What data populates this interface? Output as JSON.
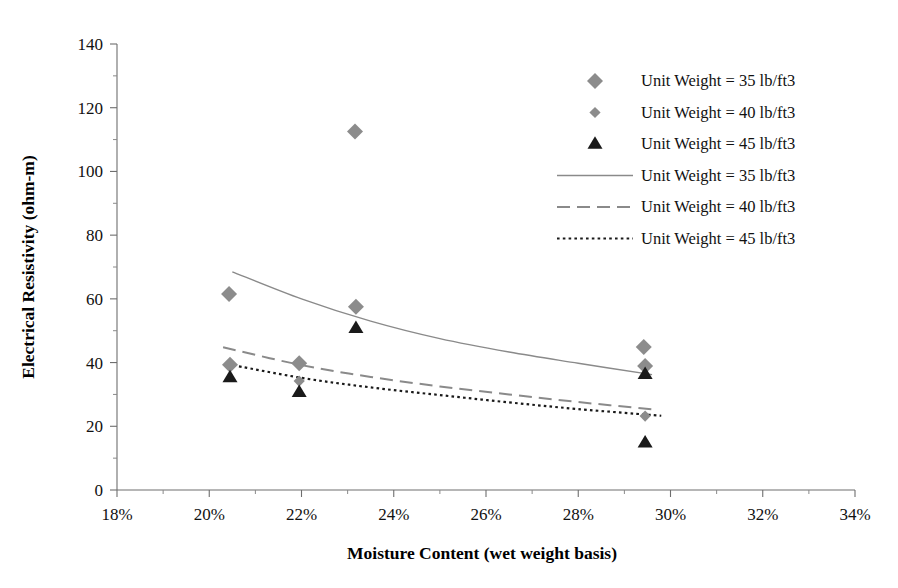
{
  "chart_data": {
    "type": "scatter",
    "title": "",
    "xlabel": "Moisture Content (wet weight basis)",
    "ylabel": "Electrical  Resistivity (ohm-m)",
    "xlim": [
      18,
      34
    ],
    "ylim": [
      0,
      140
    ],
    "x_ticks": [
      "18%",
      "20%",
      "22%",
      "24%",
      "26%",
      "28%",
      "30%",
      "32%",
      "34%"
    ],
    "x_tick_values": [
      18,
      20,
      22,
      24,
      26,
      28,
      30,
      32,
      34
    ],
    "x_minor_step": 1,
    "y_ticks": [
      "0",
      "20",
      "40",
      "60",
      "80",
      "100",
      "120",
      "140"
    ],
    "y_tick_values": [
      0,
      20,
      40,
      60,
      80,
      100,
      120,
      140
    ],
    "y_minor_step": 10,
    "grid": false,
    "legend_position": "top-right",
    "marker_color_35": "#8c8c8c",
    "marker_color_40": "#8c8c8c",
    "marker_color_45": "#1a1a1a",
    "line_color": "#8a8a8a",
    "series": [
      {
        "name": "Unit Weight = 35 lb/ft3",
        "kind": "scatter",
        "marker": "diamond-large",
        "color": "#8c8c8c",
        "points": [
          {
            "x": 20.43,
            "y": 61.5
          },
          {
            "x": 20.45,
            "y": 39.3
          },
          {
            "x": 21.95,
            "y": 39.8
          },
          {
            "x": 23.16,
            "y": 112.5
          },
          {
            "x": 23.18,
            "y": 57.5
          },
          {
            "x": 29.42,
            "y": 44.9
          },
          {
            "x": 29.45,
            "y": 38.9
          }
        ]
      },
      {
        "name": "Unit Weight = 40 lb/ft3",
        "kind": "scatter",
        "marker": "diamond-small",
        "color": "#8c8c8c",
        "points": [
          {
            "x": 21.95,
            "y": 34.2
          },
          {
            "x": 29.45,
            "y": 23.2
          }
        ]
      },
      {
        "name": "Unit Weight = 45 lb/ft3",
        "kind": "scatter",
        "marker": "triangle",
        "color": "#1a1a1a",
        "points": [
          {
            "x": 20.45,
            "y": 35.3
          },
          {
            "x": 21.95,
            "y": 30.7
          },
          {
            "x": 23.18,
            "y": 50.8
          },
          {
            "x": 29.45,
            "y": 36.3
          },
          {
            "x": 29.45,
            "y": 14.8
          }
        ]
      },
      {
        "name": "Unit Weight = 35 lb/ft3",
        "kind": "line",
        "style": "solid",
        "color": "#8a8a8a",
        "points": [
          {
            "x": 20.5,
            "y": 68.5
          },
          {
            "x": 22.0,
            "y": 60.0
          },
          {
            "x": 23.5,
            "y": 53.0
          },
          {
            "x": 25.0,
            "y": 47.5
          },
          {
            "x": 26.5,
            "y": 43.3
          },
          {
            "x": 28.0,
            "y": 39.8
          },
          {
            "x": 29.6,
            "y": 36.2
          }
        ]
      },
      {
        "name": "Unit Weight = 40 lb/ft3",
        "kind": "line",
        "style": "dashed",
        "color": "#8a8a8a",
        "points": [
          {
            "x": 20.3,
            "y": 44.8
          },
          {
            "x": 22.0,
            "y": 39.2
          },
          {
            "x": 23.5,
            "y": 35.5
          },
          {
            "x": 25.0,
            "y": 32.5
          },
          {
            "x": 26.5,
            "y": 30.0
          },
          {
            "x": 28.0,
            "y": 27.6
          },
          {
            "x": 29.7,
            "y": 25.2
          }
        ]
      },
      {
        "name": "Unit Weight = 45 lb/ft3",
        "kind": "line",
        "style": "dotted",
        "color": "#1a1a1a",
        "points": [
          {
            "x": 20.4,
            "y": 39.5
          },
          {
            "x": 22.0,
            "y": 35.2
          },
          {
            "x": 23.5,
            "y": 32.2
          },
          {
            "x": 25.0,
            "y": 29.8
          },
          {
            "x": 26.5,
            "y": 27.5
          },
          {
            "x": 28.0,
            "y": 25.4
          },
          {
            "x": 29.8,
            "y": 23.3
          }
        ]
      }
    ],
    "legend": [
      {
        "label": "Unit Weight = 35 lb/ft3",
        "type": "marker",
        "marker": "diamond-large",
        "color": "#8c8c8c"
      },
      {
        "label": "Unit Weight = 40 lb/ft3",
        "type": "marker",
        "marker": "diamond-small",
        "color": "#8c8c8c"
      },
      {
        "label": "Unit Weight = 45 lb/ft3",
        "type": "marker",
        "marker": "triangle",
        "color": "#1a1a1a"
      },
      {
        "label": "Unit Weight = 35 lb/ft3",
        "type": "line",
        "style": "solid",
        "color": "#8a8a8a"
      },
      {
        "label": "Unit Weight = 40 lb/ft3",
        "type": "line",
        "style": "dashed",
        "color": "#8a8a8a"
      },
      {
        "label": "Unit Weight = 45 lb/ft3",
        "type": "line",
        "style": "dotted",
        "color": "#1a1a1a"
      }
    ]
  }
}
